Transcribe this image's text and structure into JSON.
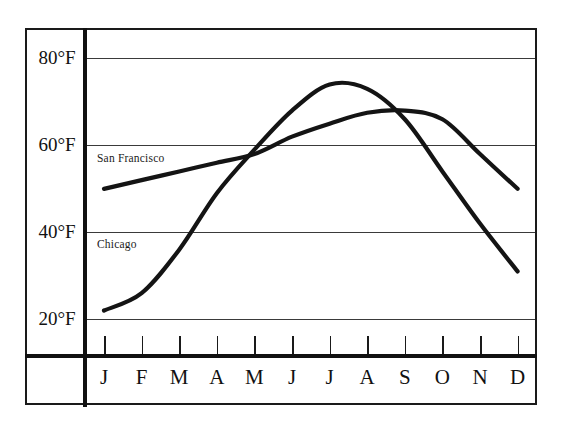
{
  "chart_data": {
    "type": "line",
    "title": "",
    "subtitle": "",
    "xlabel": "",
    "ylabel": "",
    "categories": [
      "J",
      "F",
      "M",
      "A",
      "M",
      "J",
      "J",
      "A",
      "S",
      "O",
      "N",
      "D"
    ],
    "month_names": [
      "January",
      "February",
      "March",
      "April",
      "May",
      "June",
      "July",
      "August",
      "September",
      "October",
      "November",
      "December"
    ],
    "ylim": [
      12,
      87
    ],
    "yticks": [
      20,
      40,
      60,
      80
    ],
    "ytick_labels": [
      "20°F",
      "40°F",
      "60°F",
      "80°F"
    ],
    "grid": true,
    "legend_position": "inline-annotation",
    "units": "°F",
    "series": [
      {
        "name": "San Francisco",
        "values": [
          50,
          52,
          54,
          56,
          58,
          62,
          65,
          67.5,
          68,
          66,
          58,
          50
        ]
      },
      {
        "name": "Chicago",
        "values": [
          22,
          26,
          36,
          49,
          59,
          68,
          74,
          73,
          66,
          54,
          42,
          31
        ]
      }
    ],
    "annotations": [
      {
        "text": "San Francisco",
        "series": "San Francisco"
      },
      {
        "text": "Chicago",
        "series": "Chicago"
      }
    ]
  },
  "axes": {
    "y_ticks": [
      {
        "label": "80°F",
        "value": 80
      },
      {
        "label": "60°F",
        "value": 60
      },
      {
        "label": "40°F",
        "value": 40
      },
      {
        "label": "20°F",
        "value": 20
      }
    ],
    "x_ticks": [
      {
        "label": "J"
      },
      {
        "label": "F"
      },
      {
        "label": "M"
      },
      {
        "label": "A"
      },
      {
        "label": "M"
      },
      {
        "label": "J"
      },
      {
        "label": "J"
      },
      {
        "label": "A"
      },
      {
        "label": "S"
      },
      {
        "label": "O"
      },
      {
        "label": "N"
      },
      {
        "label": "D"
      }
    ]
  },
  "colors": {
    "curve": "#141414",
    "gridline": "#3a3a3a",
    "frame": "#1a1a1a",
    "background": "#ffffff"
  }
}
